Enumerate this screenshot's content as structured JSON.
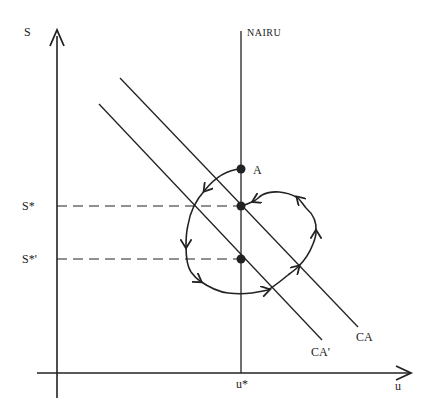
{
  "diagram": {
    "axes": {
      "y_label": "S",
      "x_label": "u"
    },
    "lines": {
      "vertical": {
        "label": "NAIRU"
      },
      "ca": {
        "label": "CA"
      },
      "ca_prime": {
        "label": "CA'"
      }
    },
    "levels": {
      "s_star": "S*",
      "s_star_prime": "S*'",
      "u_star": "u*"
    },
    "points": {
      "a": {
        "label": "A"
      }
    },
    "colors": {
      "ink": "#222222",
      "background": "#ffffff"
    }
  }
}
